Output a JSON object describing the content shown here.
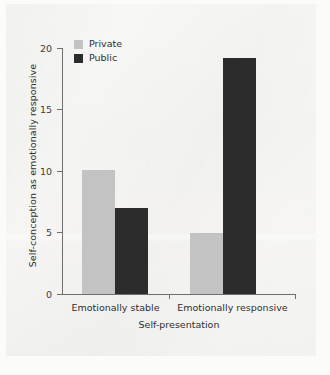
{
  "chart_data": {
    "type": "bar",
    "title": "",
    "subtitle": "",
    "xlabel": "Self-presentation",
    "ylabel": "Self-conception as emotionally responsive",
    "categories": [
      "Emotionally stable",
      "Emotionally responsive"
    ],
    "series": [
      {
        "name": "Private",
        "color": "#c3c3c3",
        "values": [
          10.1,
          5.0
        ]
      },
      {
        "name": "Public",
        "color": "#2c2c2c",
        "values": [
          7.0,
          19.2
        ]
      }
    ],
    "ylim": [
      0,
      20
    ],
    "yticks": [
      0,
      5,
      10,
      15,
      20
    ],
    "ytick_labels": [
      "0",
      "5",
      "10",
      "15",
      "20"
    ],
    "xlim_note": "two grouped categories",
    "grid": false,
    "legend_position": "upper-left-inside",
    "legend_entries": [
      "Private",
      "Public"
    ],
    "annotations": []
  },
  "axes": {
    "y_title": "Self-conception as emotionally responsive",
    "x_title": "Self-presentation",
    "y_tick_0": "0",
    "y_tick_5": "5",
    "y_tick_10": "10",
    "y_tick_15": "15",
    "y_tick_20": "20"
  },
  "categories": {
    "first": "Emotionally stable",
    "second": "Emotionally responsive"
  },
  "legend": {
    "private_label": "Private",
    "public_label": "Public"
  },
  "colors": {
    "private": "#c3c3c3",
    "public": "#2c2c2c",
    "axis": "#6e6e6e",
    "text": "#2f2f2f",
    "page": "#f5f5f3"
  }
}
